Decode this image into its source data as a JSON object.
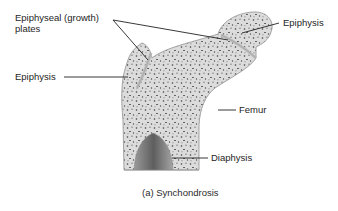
{
  "figure": {
    "caption": "(a) Synchondrosis",
    "colors": {
      "bone_fill": "#d9d9d9",
      "bone_edge": "#a8a8a8",
      "plate": "#c4c4c4",
      "speckle": "#4a4a4a",
      "leader": "#222222"
    }
  },
  "labels": {
    "epiphyseal_line1": "Epiphyseal (growth)",
    "epiphyseal_line2": "plates",
    "epiphysis_left": "Epiphysis",
    "epiphysis_right": "Epiphysis",
    "femur": "Femur",
    "diaphysis": "Diaphysis"
  }
}
